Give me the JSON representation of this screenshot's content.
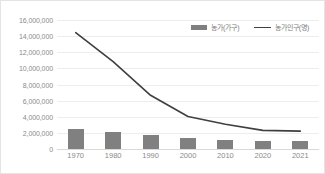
{
  "chart_data": {
    "type": "bar",
    "title": "",
    "xlabel": "",
    "ylabel": "",
    "categories": [
      "1970",
      "1980",
      "1990",
      "2000",
      "2010",
      "2020",
      "2021"
    ],
    "ylim": [
      0,
      16000000
    ],
    "ytick_step": 2000000,
    "ytick_labels": [
      "16,000,000",
      "14,000,000",
      "12,000,000",
      "10,000,000",
      "8,000,000",
      "6,000,000",
      "4,000,000",
      "2,000,000",
      "0"
    ],
    "ytick_values": [
      16000000,
      14000000,
      12000000,
      10000000,
      8000000,
      6000000,
      4000000,
      2000000,
      0
    ],
    "grid": true,
    "legend_position": "top-right",
    "series": [
      {
        "name": "농가(가구)",
        "type": "bar",
        "color": "#808080",
        "values": [
          2483000,
          2155000,
          1767000,
          1383000,
          1177000,
          1035000,
          1031000
        ]
      },
      {
        "name": "농가인구(명)",
        "type": "line",
        "color": "#3f3f3f",
        "values": [
          14422000,
          10827000,
          6661000,
          4031000,
          3063000,
          2315000,
          2215000
        ]
      }
    ]
  },
  "legend": {
    "items": [
      {
        "label": "농가(가구)",
        "marker": "bar-swatch"
      },
      {
        "label": "농가인구(명)",
        "marker": "line-swatch"
      }
    ]
  }
}
